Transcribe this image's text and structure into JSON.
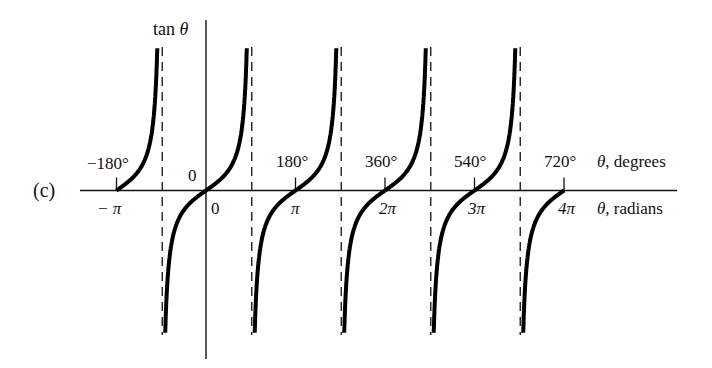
{
  "chart_data": {
    "type": "line",
    "title": "",
    "panel_label": "(c)",
    "function": "tan θ",
    "ylabel": "tan θ",
    "xlabel_top": "θ, degrees",
    "xlabel_bottom": "θ, radians",
    "degree_ticks": [
      "−180°",
      "0",
      "180°",
      "360°",
      "540°",
      "720°"
    ],
    "radian_ticks": [
      "− π",
      "0",
      "π",
      "2π",
      "3π",
      "4π"
    ],
    "x_values_rad": [
      -3.1416,
      0,
      3.1416,
      6.2832,
      9.4248,
      12.5664
    ],
    "x_values_deg": [
      -180,
      0,
      180,
      360,
      540,
      720
    ],
    "asymptotes_deg": [
      -90,
      90,
      270,
      450,
      630
    ],
    "branches": [
      {
        "from_deg": -180,
        "to_deg": -90,
        "portion": "upper half"
      },
      {
        "from_deg": -90,
        "to_deg": 90,
        "portion": "full"
      },
      {
        "from_deg": 90,
        "to_deg": 270,
        "portion": "full"
      },
      {
        "from_deg": 270,
        "to_deg": 450,
        "portion": "full"
      },
      {
        "from_deg": 450,
        "to_deg": 630,
        "portion": "full"
      },
      {
        "from_deg": 630,
        "to_deg": 720,
        "portion": "lower half"
      }
    ],
    "zeros_deg": [
      -180,
      0,
      180,
      360,
      540,
      720
    ],
    "grid": false,
    "asymptote_style": "dashed",
    "legend": null
  },
  "labels": {
    "panel": "(c)",
    "ylabel_text": "tan ",
    "ylabel_var": "θ",
    "deg_axis_var": "θ",
    "deg_axis_text": ", degrees",
    "rad_axis_var": "θ",
    "rad_axis_text": ", radians",
    "deg_neg180": "−180°",
    "deg_0": "0",
    "deg_180": "180°",
    "deg_360": "360°",
    "deg_540": "540°",
    "deg_720": "720°",
    "rad_negpi": "− π",
    "rad_0": "0",
    "rad_pi": "π",
    "rad_2pi": "2π",
    "rad_3pi": "3π",
    "rad_4pi": "4π"
  },
  "colors": {
    "curve": "#000000",
    "axis": "#111111",
    "asymptote": "#222222",
    "background": "#ffffff"
  }
}
